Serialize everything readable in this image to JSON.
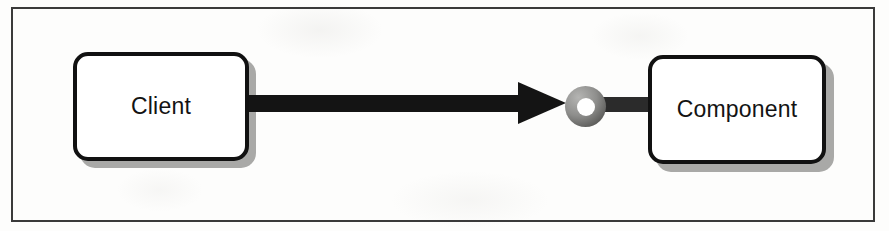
{
  "diagram": {
    "type": "uml-component-diagram",
    "notation": "ball-and-socket provided interface",
    "background_color": "#fdfdfc",
    "frame": {
      "border_color": "#3a3a3a",
      "border_width_px": 2
    },
    "nodes": [
      {
        "id": "client",
        "label": "Client",
        "shape": "rounded-rectangle",
        "fill_color": "#ffffff",
        "border_color": "#111111",
        "shadow_color": "#a9a9a7"
      },
      {
        "id": "component",
        "label": "Component",
        "shape": "rounded-rectangle",
        "fill_color": "#ffffff",
        "border_color": "#111111",
        "shadow_color": "#a9a9a7"
      }
    ],
    "connector": {
      "id": "dependency-arrow",
      "from": "client",
      "to": "component",
      "style": "solid-filled-arrow",
      "direction": "right",
      "color": "#141414"
    },
    "interface": {
      "id": "provided-interface-ball",
      "style": "lollipop-ring",
      "ring_color": "#8e8e8c",
      "hole_color": "#ffffff"
    }
  }
}
